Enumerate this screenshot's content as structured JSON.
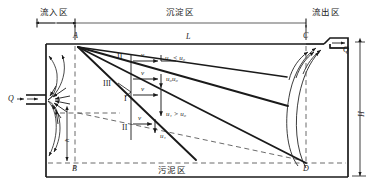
{
  "figure": {
    "zones": {
      "inflow": "流入区",
      "settling": "沉淀区",
      "outflow": "流出区",
      "sludge": "污泥区"
    },
    "corners": {
      "a": "A",
      "b": "B",
      "c": "C",
      "d": "D"
    },
    "dimensions": {
      "length": "L",
      "height": "H",
      "inlet_depth": "h"
    },
    "flow": {
      "inlet_label": "Q",
      "outlet_label": "Q"
    },
    "velocity_marks": [
      {
        "v": "v",
        "u": "u",
        "u_sub": "1",
        "rel": "<",
        "u0": "u",
        "u0_sub": "0"
      },
      {
        "v": "v",
        "u": "u",
        "u_sub": "0",
        "rel": "",
        "u0": "u",
        "u0_sub": "0"
      },
      {
        "v": "v",
        "u": "u",
        "u_sub": "1",
        "rel": ">",
        "u0": "u",
        "u0_sub": "0"
      },
      {
        "v": "v",
        "u": "u",
        "u_sub": "i",
        "rel": "",
        "u0": "",
        "u0_sub": ""
      }
    ],
    "velocity_text": {
      "v_symbol": "v",
      "row1": "u₁ < u₀",
      "row2": "u₀u₀",
      "row3": "u₁ > u₀",
      "row4": "u₁"
    },
    "trajectory_labels": {
      "one": "I",
      "two_top": "II",
      "two_bottom": "II",
      "three": "III"
    },
    "colors": {
      "stroke": "#1a1a1a",
      "dashed": "#6b6b6b",
      "background": "#ffffff"
    }
  }
}
